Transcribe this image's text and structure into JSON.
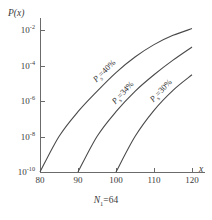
{
  "chart_data": {
    "type": "line",
    "title": "",
    "xlabel": "x",
    "ylabel": "P(x)",
    "caption": "N1=64",
    "caption_symbol": "N",
    "caption_subscript": "1",
    "caption_value": "=64",
    "xlim": [
      80,
      120
    ],
    "ylim": [
      1e-10,
      0.01
    ],
    "yscale": "log",
    "grid": false,
    "legend": "inline-labels",
    "xticks": [
      80,
      90,
      100,
      110,
      120
    ],
    "xtick_labels": [
      "80",
      "90",
      "100",
      "110",
      "120"
    ],
    "yticks": [
      0.01,
      0.0001,
      1e-06,
      1e-08,
      1e-10
    ],
    "ytick_labels": [
      "-2",
      "-4",
      "-6",
      "-8",
      "-10"
    ],
    "ytick_mantissa": "10",
    "series": [
      {
        "name": "Ps=40%",
        "label_symbol": "P",
        "label_subscript": "s",
        "label_value": "=40%",
        "x": [
          80,
          85,
          90,
          95,
          100,
          105,
          110,
          115,
          120
        ],
        "y": [
          1e-10,
          1e-08,
          2.5e-07,
          3.5e-06,
          4e-05,
          0.0003,
          0.0015,
          0.005,
          0.012
        ]
      },
      {
        "name": "Ps=34%",
        "label_symbol": "P",
        "label_subscript": "s",
        "label_value": "=34%",
        "x": [
          90,
          95,
          100,
          105,
          110,
          115,
          120
        ],
        "y": [
          1e-10,
          1e-08,
          2.5e-07,
          3.5e-06,
          3e-05,
          0.0002,
          0.0011
        ]
      },
      {
        "name": "Ps=30%",
        "label_symbol": "P",
        "label_subscript": "s",
        "label_value": "=30%",
        "x": [
          100,
          105,
          110,
          115,
          120
        ],
        "y": [
          1e-10,
          1e-08,
          3e-07,
          4e-06,
          3e-05
        ]
      }
    ]
  }
}
